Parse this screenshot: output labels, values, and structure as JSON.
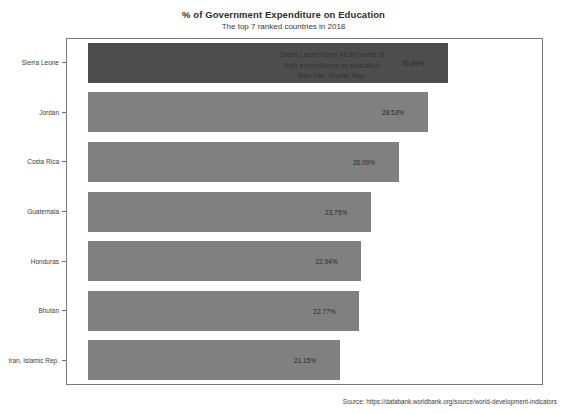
{
  "chart_data": {
    "type": "bar",
    "orientation": "horizontal",
    "title": "% of Government Expenditure on Education",
    "subtitle": "The top 7 ranked countries in 2018",
    "xlabel": "",
    "ylabel": "",
    "categories": [
      "Sierra Leone",
      "Jordan",
      "Costa Rica",
      "Guatemala",
      "Honduras",
      "Bhutan",
      "Iran, Islamic Rep."
    ],
    "values": [
      30.2,
      28.53,
      26.09,
      23.75,
      22.94,
      22.77,
      21.15
    ],
    "value_labels": [
      "30.20%",
      "28.53%",
      "26.09%",
      "23.75%",
      "22.94%",
      "22.77%",
      "21.15%"
    ],
    "xlim": [
      0,
      37.5
    ],
    "grid": false,
    "legend": "none",
    "highlight_index": 0,
    "colors": {
      "bar": "#808080",
      "bar_highlight": "#4d4d4d",
      "frame": "#7a7a7a",
      "background": "#ffffff",
      "text": "#3a3a3a"
    },
    "annotation": {
      "lines": [
        "Sierra Leone spent 42.8% more of",
        "their expenditures on education",
        "than Iran, Islamic Rep."
      ]
    }
  },
  "source": {
    "text": "Source:  https://databank.worldbank.org/source/world-development-indicators"
  }
}
